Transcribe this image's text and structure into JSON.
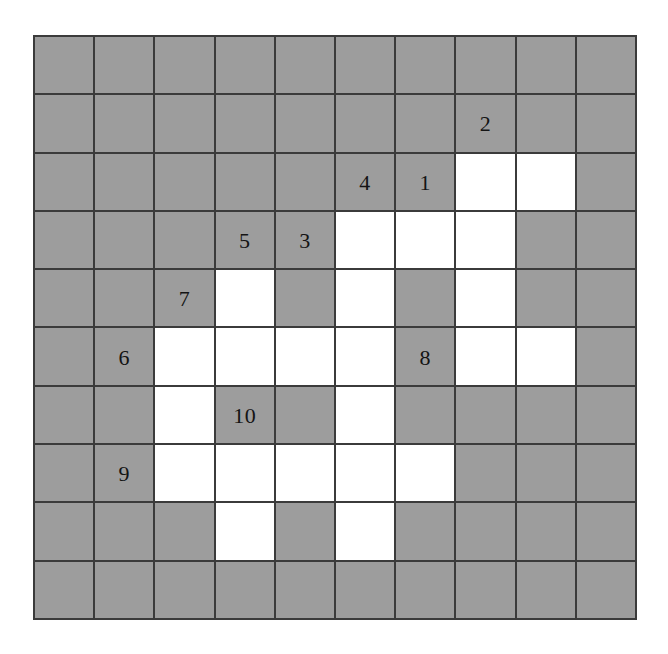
{
  "figure": {
    "kind": "nonogram-style-numbered-grid",
    "rows": 10,
    "cols": 10,
    "colors": {
      "filled_cell": "#9d9d9d",
      "empty_cell": "#ffffff",
      "grid_line": "#3b3b3b",
      "label_text": "#141414",
      "background": "#ffffff"
    }
  },
  "grid": {
    "cells": [
      [
        "filled",
        "filled",
        "filled",
        "filled",
        "filled",
        "filled",
        "filled",
        "filled",
        "filled",
        "filled"
      ],
      [
        "filled",
        "filled",
        "filled",
        "filled",
        "filled",
        "filled",
        "filled",
        "filled",
        "filled",
        "filled"
      ],
      [
        "filled",
        "filled",
        "filled",
        "filled",
        "filled",
        "filled",
        "filled",
        "empty",
        "empty",
        "filled"
      ],
      [
        "filled",
        "filled",
        "filled",
        "filled",
        "filled",
        "empty",
        "empty",
        "empty",
        "filled",
        "filled"
      ],
      [
        "filled",
        "filled",
        "filled",
        "empty",
        "filled",
        "empty",
        "filled",
        "empty",
        "filled",
        "filled"
      ],
      [
        "filled",
        "filled",
        "empty",
        "empty",
        "empty",
        "empty",
        "filled",
        "empty",
        "empty",
        "filled"
      ],
      [
        "filled",
        "filled",
        "empty",
        "filled",
        "filled",
        "empty",
        "filled",
        "filled",
        "filled",
        "filled"
      ],
      [
        "filled",
        "filled",
        "empty",
        "empty",
        "empty",
        "empty",
        "empty",
        "filled",
        "filled",
        "filled"
      ],
      [
        "filled",
        "filled",
        "filled",
        "empty",
        "filled",
        "empty",
        "filled",
        "filled",
        "filled",
        "filled"
      ],
      [
        "filled",
        "filled",
        "filled",
        "filled",
        "filled",
        "filled",
        "filled",
        "filled",
        "filled",
        "filled"
      ]
    ],
    "labels": [
      {
        "row": 1,
        "col": 7,
        "text": "2"
      },
      {
        "row": 2,
        "col": 5,
        "text": "4"
      },
      {
        "row": 2,
        "col": 6,
        "text": "1"
      },
      {
        "row": 3,
        "col": 3,
        "text": "5"
      },
      {
        "row": 3,
        "col": 4,
        "text": "3"
      },
      {
        "row": 4,
        "col": 2,
        "text": "7"
      },
      {
        "row": 5,
        "col": 1,
        "text": "6"
      },
      {
        "row": 5,
        "col": 6,
        "text": "8"
      },
      {
        "row": 6,
        "col": 3,
        "text": "10"
      },
      {
        "row": 7,
        "col": 1,
        "text": "9"
      }
    ]
  }
}
